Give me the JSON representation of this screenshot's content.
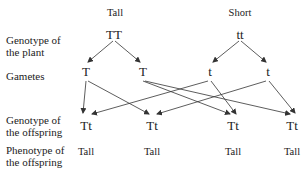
{
  "row_labels": {
    "genotype_plant": "Genotype of the plant",
    "gametes": "Gametes",
    "genotype_offspring": "Genotype of the offspring",
    "phenotype_offspring": "Phenotype of the offspring"
  },
  "row_labels_lines": {
    "genotype_plant": [
      "Genotype of",
      "the plant"
    ],
    "gametes": [
      "Gametes"
    ],
    "genotype_offspring": [
      "Genotype of",
      "the offspring"
    ],
    "phenotype_offspring": [
      "Phenotype of",
      "the offspring"
    ]
  },
  "parents": [
    {
      "phenotype": "Tall",
      "genotype": "TT"
    },
    {
      "phenotype": "Short",
      "genotype": "tt"
    }
  ],
  "gametes": [
    "T",
    "T",
    "t",
    "t"
  ],
  "offspring": [
    {
      "genotype": "Tt",
      "phenotype": "Tall"
    },
    {
      "genotype": "Tt",
      "phenotype": "Tall"
    },
    {
      "genotype": "Tt",
      "phenotype": "Tall"
    },
    {
      "genotype": "Tt",
      "phenotype": "Tall"
    }
  ],
  "connections": {
    "parent_to_gamete": [
      [
        0,
        0
      ],
      [
        0,
        1
      ],
      [
        1,
        2
      ],
      [
        1,
        3
      ]
    ],
    "gamete_to_offspring": [
      [
        0,
        0
      ],
      [
        0,
        1
      ],
      [
        1,
        2
      ],
      [
        1,
        3
      ],
      [
        2,
        0
      ],
      [
        2,
        2
      ],
      [
        3,
        1
      ],
      [
        3,
        3
      ]
    ]
  },
  "line_color": "#333333"
}
